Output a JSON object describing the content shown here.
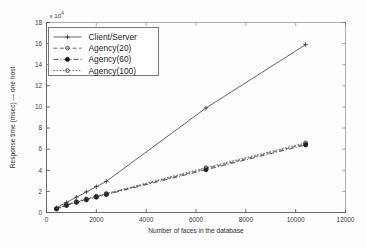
{
  "chart_data": {
    "type": "line",
    "title": "",
    "xlabel": "Number of faces in the database",
    "ylabel": "Response time (msec) --- one host",
    "y_multiplier_label": "x 10",
    "y_multiplier_exponent": "4",
    "xlim": [
      0,
      12000
    ],
    "ylim": [
      0,
      18
    ],
    "xticks": [
      0,
      2000,
      4000,
      6000,
      8000,
      10000,
      12000
    ],
    "xticklabels": [
      "0",
      "2000",
      "4000",
      "6000",
      "8000",
      "10000",
      "12000"
    ],
    "yticks": [
      0,
      2,
      4,
      6,
      8,
      10,
      12,
      14,
      16,
      18
    ],
    "yticklabels": [
      "0",
      "2",
      "4",
      "6",
      "8",
      "10",
      "12",
      "14",
      "16",
      "18"
    ],
    "grid": false,
    "legend_position": "upper left",
    "series": [
      {
        "name": "Client/Server",
        "linestyle": "solid",
        "marker": "plus",
        "color": "#4a4a4a",
        "x": [
          400,
          800,
          1200,
          1600,
          2000,
          2400,
          6400,
          10400
        ],
        "y": [
          0.45,
          0.95,
          1.45,
          1.95,
          2.45,
          2.95,
          9.9,
          15.9
        ]
      },
      {
        "name": "Agency(20)",
        "linestyle": "dashed",
        "marker": "circle-open",
        "color": "#4a4a4a",
        "x": [
          400,
          800,
          1200,
          1600,
          2000,
          2400,
          6400,
          10400
        ],
        "y": [
          0.35,
          0.7,
          1.0,
          1.25,
          1.5,
          1.75,
          4.15,
          6.5
        ]
      },
      {
        "name": "Agency(60)",
        "linestyle": "dashdot",
        "marker": "circle-filled",
        "color": "#3a3a3a",
        "x": [
          400,
          800,
          1200,
          1600,
          2000,
          2400,
          6400,
          10400
        ],
        "y": [
          0.33,
          0.66,
          0.96,
          1.2,
          1.45,
          1.7,
          4.05,
          6.4
        ]
      },
      {
        "name": "Agency(100)",
        "linestyle": "dotted",
        "marker": "circle-open",
        "color": "#5a5a5a",
        "x": [
          400,
          800,
          1200,
          1600,
          2000,
          2400,
          6400,
          10400
        ],
        "y": [
          0.37,
          0.73,
          1.04,
          1.3,
          1.55,
          1.8,
          4.25,
          6.6
        ]
      }
    ]
  },
  "legend": {
    "entries": [
      {
        "label": "Client/Server"
      },
      {
        "label": "Agency(20)"
      },
      {
        "label": "Agency(60)"
      },
      {
        "label": "Agency(100)"
      }
    ]
  }
}
